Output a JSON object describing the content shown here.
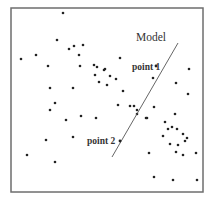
{
  "diagram": {
    "title": "",
    "frame": {
      "x": 11,
      "y": 8,
      "width": 192,
      "height": 184,
      "color": "#6e6e6e"
    },
    "model": {
      "label": "Model",
      "label_pos": [
        136,
        41
      ],
      "line": {
        "x1": 178,
        "y1": 43,
        "x2": 112,
        "y2": 157
      },
      "color": "#555555"
    },
    "points_labeled": [
      {
        "label": "point 1",
        "label_pos": [
          132,
          70
        ],
        "dot": [
          156,
          66
        ]
      },
      {
        "label": "point 2",
        "label_pos": [
          87,
          144
        ],
        "dot": [
          120,
          141
        ]
      }
    ],
    "scatter": [
      [
        63,
        13
      ],
      [
        57,
        40
      ],
      [
        69,
        49
      ],
      [
        74,
        46
      ],
      [
        83,
        45
      ],
      [
        79,
        55
      ],
      [
        21,
        59
      ],
      [
        36,
        55
      ],
      [
        48,
        66
      ],
      [
        80,
        66
      ],
      [
        50,
        88
      ],
      [
        73,
        88
      ],
      [
        94,
        65
      ],
      [
        97,
        67
      ],
      [
        95,
        75
      ],
      [
        104,
        70
      ],
      [
        99,
        82
      ],
      [
        120,
        58
      ],
      [
        105,
        69
      ],
      [
        110,
        76
      ],
      [
        116,
        79
      ],
      [
        107,
        85
      ],
      [
        123,
        91
      ],
      [
        153,
        78
      ],
      [
        176,
        83
      ],
      [
        189,
        69
      ],
      [
        188,
        94
      ],
      [
        55,
        103
      ],
      [
        50,
        110
      ],
      [
        66,
        120
      ],
      [
        81,
        116
      ],
      [
        96,
        118
      ],
      [
        46,
        140
      ],
      [
        73,
        137
      ],
      [
        27,
        155
      ],
      [
        55,
        162
      ],
      [
        118,
        105
      ],
      [
        130,
        106
      ],
      [
        134,
        106
      ],
      [
        137,
        110
      ],
      [
        137,
        114
      ],
      [
        146,
        118
      ],
      [
        147,
        118
      ],
      [
        154,
        107
      ],
      [
        175,
        114
      ],
      [
        165,
        122
      ],
      [
        168,
        129
      ],
      [
        172,
        127
      ],
      [
        177,
        129
      ],
      [
        163,
        136
      ],
      [
        183,
        134
      ],
      [
        187,
        138
      ],
      [
        185,
        141
      ],
      [
        170,
        144
      ],
      [
        178,
        145
      ],
      [
        149,
        153
      ],
      [
        176,
        152
      ],
      [
        183,
        155
      ],
      [
        196,
        153
      ],
      [
        154,
        177
      ],
      [
        173,
        180
      ],
      [
        197,
        180
      ]
    ],
    "dot_color": "#222222"
  }
}
